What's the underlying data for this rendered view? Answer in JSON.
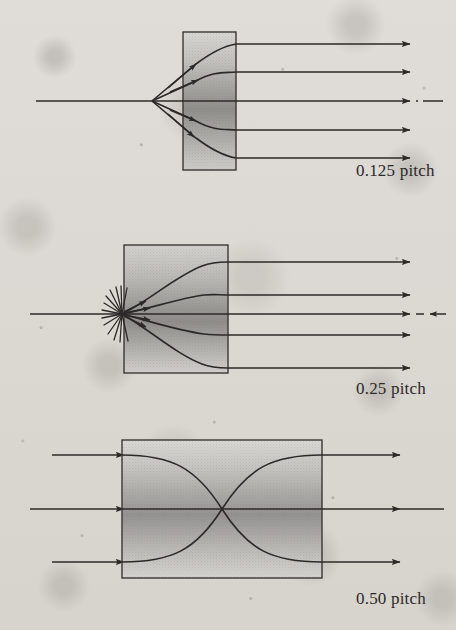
{
  "figure": {
    "canvas": {
      "width": 456,
      "height": 630
    },
    "background_color": "#eceae7",
    "ink_color": "#2c2a29",
    "lens_fill_light": "#d8d6d2",
    "lens_fill_dark": "#8e8c89",
    "panels": [
      {
        "id": "panel-0125",
        "label": "0.125 pitch",
        "label_x": 356,
        "label_y": 161,
        "lens": {
          "x": 183,
          "y": 32,
          "width": 53,
          "height": 138
        },
        "axis": {
          "y": 101,
          "x_start": 36,
          "x_end": 444
        },
        "ray_description": "point source on axis at lens face collimated into five parallel output rays",
        "source_x": 152,
        "ray_output_ys": [
          44,
          72,
          101,
          130,
          158
        ],
        "ray_arrow_tip_x": 410,
        "dash_dot_axis": true
      },
      {
        "id": "panel-025",
        "label": "0.25 pitch",
        "label_x": 356,
        "label_y": 379,
        "lens": {
          "x": 124,
          "y": 245,
          "width": 104,
          "height": 128
        },
        "axis": {
          "y": 314,
          "x_start": 30,
          "x_end": 444
        },
        "ray_description": "diverging point source imaged to collimated parallel output beam",
        "source_x": 122,
        "ray_output_ys": [
          262,
          295,
          314,
          335,
          368
        ],
        "ray_arrow_tip_x": 410,
        "dash_dot_axis": true
      },
      {
        "id": "panel-050",
        "label": "0.50 pitch",
        "label_x": 356,
        "label_y": 589,
        "lens": {
          "x": 122,
          "y": 440,
          "width": 200,
          "height": 138
        },
        "axis": {
          "y": 509,
          "x_start": 30,
          "x_end": 444
        },
        "ray_description": "three parallel input rays inverted through one half pitch, image flipped",
        "ray_input_ys": [
          455,
          509,
          562
        ],
        "ray_input_start_x": 52,
        "ray_arrow_tip_x": 400,
        "dash_dot_axis": false
      }
    ]
  }
}
